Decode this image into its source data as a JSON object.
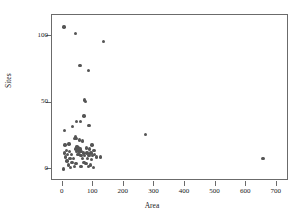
{
  "chart_data": {
    "type": "scatter",
    "title": "",
    "xlabel": "Area",
    "ylabel": "Sites",
    "xlim": [
      -35,
      740
    ],
    "ylim": [
      -9,
      116
    ],
    "grid": false,
    "legend": false,
    "marker": {
      "shape": "circle",
      "color": "#555555",
      "size_px": 3.4
    },
    "axis_color": "#6b6b6b",
    "xticks": [
      0,
      100,
      200,
      300,
      400,
      500,
      600,
      700
    ],
    "xtick_labels": [
      "0",
      "100",
      "200",
      "300",
      "400",
      "500",
      "600",
      "700"
    ],
    "yticks": [
      0,
      50,
      100
    ],
    "ytick_labels": [
      "0",
      "50",
      "100"
    ],
    "points": [
      {
        "x": 4,
        "y": 107
      },
      {
        "x": 41,
        "y": 102
      },
      {
        "x": 134,
        "y": 96
      },
      {
        "x": 56,
        "y": 78
      },
      {
        "x": 84,
        "y": 74
      },
      {
        "x": 72,
        "y": 52
      },
      {
        "x": 74,
        "y": 51
      },
      {
        "x": 70,
        "y": 40
      },
      {
        "x": 46,
        "y": 36
      },
      {
        "x": 58,
        "y": 36
      },
      {
        "x": 86,
        "y": 33
      },
      {
        "x": 33,
        "y": 32
      },
      {
        "x": 5,
        "y": 29
      },
      {
        "x": 270,
        "y": 26
      },
      {
        "x": 42,
        "y": 24
      },
      {
        "x": 44,
        "y": 23
      },
      {
        "x": 39,
        "y": 23
      },
      {
        "x": 55,
        "y": 22
      },
      {
        "x": 65,
        "y": 21
      },
      {
        "x": 20,
        "y": 19
      },
      {
        "x": 8,
        "y": 18
      },
      {
        "x": 96,
        "y": 18
      },
      {
        "x": 45,
        "y": 17
      },
      {
        "x": 49,
        "y": 17
      },
      {
        "x": 52,
        "y": 16
      },
      {
        "x": 47,
        "y": 16
      },
      {
        "x": 43,
        "y": 15
      },
      {
        "x": 50,
        "y": 15
      },
      {
        "x": 54,
        "y": 15
      },
      {
        "x": 58,
        "y": 15
      },
      {
        "x": 78,
        "y": 16
      },
      {
        "x": 88,
        "y": 15
      },
      {
        "x": 102,
        "y": 14
      },
      {
        "x": 13,
        "y": 14
      },
      {
        "x": 22,
        "y": 13
      },
      {
        "x": 46,
        "y": 13
      },
      {
        "x": 51,
        "y": 13
      },
      {
        "x": 56,
        "y": 13
      },
      {
        "x": 62,
        "y": 13
      },
      {
        "x": 68,
        "y": 12
      },
      {
        "x": 80,
        "y": 12
      },
      {
        "x": 92,
        "y": 12
      },
      {
        "x": 104,
        "y": 11
      },
      {
        "x": 6,
        "y": 12
      },
      {
        "x": 16,
        "y": 11
      },
      {
        "x": 28,
        "y": 11
      },
      {
        "x": 48,
        "y": 11
      },
      {
        "x": 53,
        "y": 11
      },
      {
        "x": 60,
        "y": 10
      },
      {
        "x": 72,
        "y": 10
      },
      {
        "x": 86,
        "y": 10
      },
      {
        "x": 98,
        "y": 10
      },
      {
        "x": 110,
        "y": 9
      },
      {
        "x": 124,
        "y": 9
      },
      {
        "x": 10,
        "y": 9
      },
      {
        "x": 24,
        "y": 8
      },
      {
        "x": 36,
        "y": 8
      },
      {
        "x": 64,
        "y": 8
      },
      {
        "x": 82,
        "y": 8
      },
      {
        "x": 94,
        "y": 7
      },
      {
        "x": 655,
        "y": 8
      },
      {
        "x": 14,
        "y": 6
      },
      {
        "x": 30,
        "y": 5
      },
      {
        "x": 44,
        "y": 4
      },
      {
        "x": 70,
        "y": 5
      },
      {
        "x": 76,
        "y": 4
      },
      {
        "x": 90,
        "y": 3
      },
      {
        "x": 18,
        "y": 3
      },
      {
        "x": 38,
        "y": 2
      },
      {
        "x": 60,
        "y": 2
      },
      {
        "x": 84,
        "y": 2
      },
      {
        "x": 100,
        "y": 1
      },
      {
        "x": 26,
        "y": 1
      },
      {
        "x": 3,
        "y": 0
      }
    ]
  }
}
